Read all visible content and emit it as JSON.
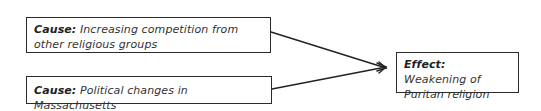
{
  "diagram": {
    "type": "cause-effect",
    "causes": [
      {
        "label": "Cause:",
        "text": "Increasing competition from other religious groups"
      },
      {
        "label": "Cause:",
        "text": "Political changes in Massachusetts"
      }
    ],
    "effect": {
      "label": "Effect:",
      "text": "Weakening of Puritan religion"
    },
    "colors": {
      "stroke": "#2a2a2a",
      "background": "#ffffff"
    }
  }
}
